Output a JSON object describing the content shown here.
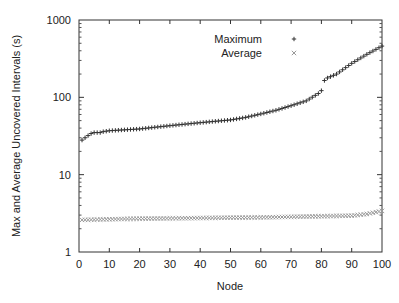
{
  "chart_data": {
    "type": "scatter",
    "title": "",
    "xlabel": "Node",
    "ylabel": "Max and Average Uncovered Intervals (s)",
    "xlim": [
      0,
      100
    ],
    "ylim": [
      1,
      1000
    ],
    "yscale": "log",
    "grid": false,
    "legend_position": "top-center",
    "x_ticks": [
      "0",
      "10",
      "20",
      "30",
      "40",
      "50",
      "60",
      "70",
      "80",
      "90",
      "100"
    ],
    "y_ticks": [
      "1",
      "10",
      "100",
      "1000"
    ],
    "series": [
      {
        "name": "Maximum",
        "marker": "+",
        "anchors": [
          [
            1,
            28
          ],
          [
            2,
            30
          ],
          [
            3,
            32
          ],
          [
            4,
            34
          ],
          [
            5,
            35
          ],
          [
            7,
            35
          ],
          [
            8,
            36
          ],
          [
            10,
            37
          ],
          [
            15,
            38
          ],
          [
            20,
            39
          ],
          [
            25,
            41
          ],
          [
            30,
            43
          ],
          [
            35,
            45
          ],
          [
            40,
            47
          ],
          [
            45,
            49
          ],
          [
            50,
            51
          ],
          [
            55,
            55
          ],
          [
            60,
            61
          ],
          [
            65,
            68
          ],
          [
            70,
            78
          ],
          [
            75,
            90
          ],
          [
            79,
            112
          ],
          [
            80,
            122
          ],
          [
            81,
            165
          ],
          [
            82,
            178
          ],
          [
            85,
            200
          ],
          [
            90,
            275
          ],
          [
            95,
            360
          ],
          [
            100,
            460
          ]
        ]
      },
      {
        "name": "Average",
        "marker": "x",
        "anchors": [
          [
            1,
            2.6
          ],
          [
            10,
            2.65
          ],
          [
            20,
            2.7
          ],
          [
            30,
            2.72
          ],
          [
            40,
            2.75
          ],
          [
            50,
            2.78
          ],
          [
            60,
            2.8
          ],
          [
            70,
            2.85
          ],
          [
            80,
            2.9
          ],
          [
            90,
            2.95
          ],
          [
            95,
            3.1
          ],
          [
            100,
            3.4
          ]
        ]
      }
    ]
  }
}
